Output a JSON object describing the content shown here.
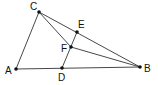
{
  "diagram": {
    "type": "geometry-triangle",
    "points": [
      {
        "name": "A",
        "x": 16,
        "y": 69,
        "lx": 5,
        "ly": 74
      },
      {
        "name": "B",
        "x": 140,
        "y": 67,
        "lx": 144,
        "ly": 72
      },
      {
        "name": "C",
        "x": 39,
        "y": 12,
        "lx": 30,
        "ly": 10
      },
      {
        "name": "D",
        "x": 62,
        "y": 68,
        "lx": 58,
        "ly": 81
      },
      {
        "name": "E",
        "x": 77,
        "y": 32,
        "lx": 78,
        "ly": 28
      },
      {
        "name": "F",
        "x": 71,
        "y": 47,
        "lx": 61,
        "ly": 52
      }
    ],
    "segments": [
      [
        "A",
        "C"
      ],
      [
        "C",
        "B"
      ],
      [
        "A",
        "B"
      ],
      [
        "C",
        "F"
      ],
      [
        "F",
        "B"
      ],
      [
        "D",
        "E"
      ]
    ],
    "colors": {
      "line": "#333333",
      "point": "#111111"
    }
  }
}
